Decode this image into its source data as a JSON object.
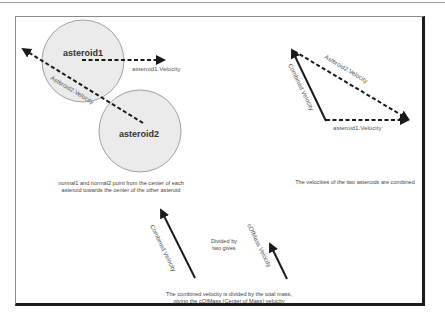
{
  "diagram": {
    "panel_collision": {
      "asteroid1_label": "asteroid1",
      "asteroid2_label": "asteroid2",
      "asteroid1_velocity_label": "asteroid1.Velocity",
      "asteroid2_velocity_label": "Asteroid2.Velocity",
      "caption_line1": "normal1 and normal2 point from the center of each",
      "caption_line2": "asteroid towards the center of the other asteroid"
    },
    "panel_combine": {
      "asteroid2_velocity_label": "Asteroid2.Velocity",
      "asteroid1_velocity_label": "asteroid1.Velocity",
      "combined_label": "Combined Velocity",
      "caption": "The velocities of the two asteroids are combined"
    },
    "panel_divide": {
      "combined_label": "Combined Velocity",
      "divided_line1": "Divided by",
      "divided_line2": "two gives",
      "cofmass_label": "cOfMass Velocity",
      "caption_line1": "The combined velocity is divided by the total mass,",
      "caption_line2": "giving the cOfMass (Center of Mass) velocity"
    },
    "colors": {
      "circle_fill": "#ebebeb",
      "circle_stroke": "#8a8a8a",
      "arrow": "#1a1a1a"
    }
  }
}
